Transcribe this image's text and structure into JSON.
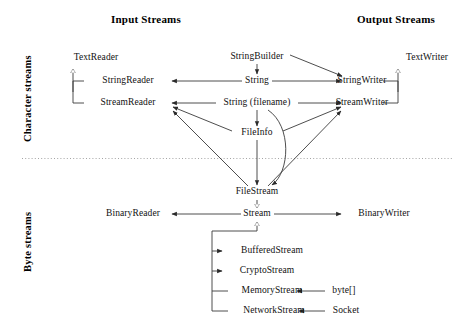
{
  "figure": {
    "title_left": "Input Streams",
    "title_right": "Output Streams",
    "band_upper": "Character streams",
    "band_lower": "Byte streams"
  },
  "nodes": {
    "text_reader": "TextReader",
    "text_writer": "TextWriter",
    "string_reader": "StringReader",
    "string_writer": "StringWriter",
    "stream_reader": "StreamReader",
    "stream_writer": "StreamWriter",
    "string_builder": "StringBuilder",
    "string": "String",
    "string_filename": "String (filename)",
    "file_info": "FileInfo",
    "file_stream": "FileStream",
    "binary_reader": "BinaryReader",
    "stream": "Stream",
    "binary_writer": "BinaryWriter",
    "buffered_stream": "BufferedStream",
    "crypto_stream": "CryptoStream",
    "memory_stream": "MemoryStream",
    "network_stream": "NetworkStream",
    "byte_array": "byte[]",
    "socket": "Socket"
  },
  "colors": {
    "background": "#ffffff",
    "ink": "#111111",
    "line": "#3a3a3a",
    "divider": "#9a9a9a"
  }
}
